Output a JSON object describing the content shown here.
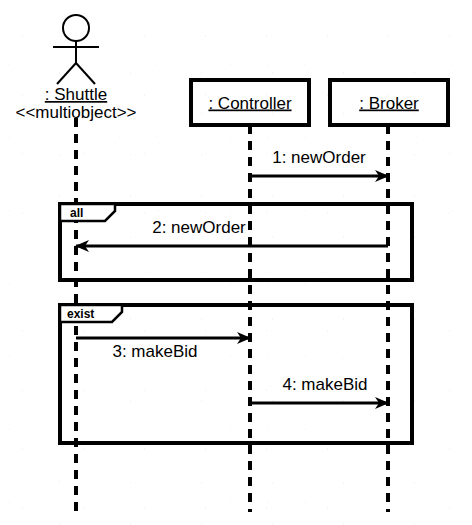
{
  "diagram": {
    "type": "uml-sequence-diagram",
    "background_color": "#ffffff",
    "line_color": "#000000",
    "canvas": {
      "width": 472,
      "height": 525
    }
  },
  "participants": [
    {
      "id": "shuttle",
      "name": ": Shuttle",
      "stereotype": "<<multiobject>>",
      "notation": "actor",
      "underlined": true,
      "lifeline_x": 76,
      "lifeline_top": 118,
      "lifeline_bottom": 512,
      "actor_icon": "stick-figure-actor-icon"
    },
    {
      "id": "controller",
      "name": ": Controller",
      "stereotype": "",
      "notation": "object-box",
      "underlined": true,
      "lifeline_x": 250,
      "lifeline_top": 125,
      "lifeline_bottom": 512,
      "box": {
        "x": 191,
        "y": 80,
        "width": 118,
        "height": 45
      }
    },
    {
      "id": "broker",
      "name": ": Broker",
      "stereotype": "",
      "notation": "object-box",
      "underlined": true,
      "lifeline_x": 388,
      "lifeline_top": 125,
      "lifeline_bottom": 512,
      "box": {
        "x": 330,
        "y": 80,
        "width": 118,
        "height": 45
      }
    }
  ],
  "messages": [
    {
      "seq": "1",
      "label": "1: newOrder",
      "from": "controller",
      "to": "broker",
      "x1": 250,
      "x2": 388,
      "y": 176,
      "direction": "right",
      "label_x": 319,
      "label_y": 163,
      "label_anchor": "middle"
    },
    {
      "seq": "2",
      "label": "2: newOrder",
      "from": "broker",
      "to": "shuttle",
      "x1": 388,
      "x2": 76,
      "y": 246,
      "direction": "left",
      "label_x": 199,
      "label_y": 233,
      "label_anchor": "middle"
    },
    {
      "seq": "3",
      "label": "3: makeBid",
      "from": "shuttle",
      "to": "controller",
      "x1": 76,
      "x2": 250,
      "y": 338,
      "direction": "right",
      "label_x": 155,
      "label_y": 357,
      "label_anchor": "middle"
    },
    {
      "seq": "4",
      "label": "4: makeBid",
      "from": "controller",
      "to": "broker",
      "x1": 250,
      "x2": 388,
      "y": 403,
      "direction": "right",
      "label_x": 325,
      "label_y": 390,
      "label_anchor": "middle"
    }
  ],
  "frames": [
    {
      "id": "frame-all",
      "label": "all",
      "x": 60,
      "y": 204,
      "width": 352,
      "height": 76,
      "tab_width": 55,
      "tab_height": 17,
      "tab_notch": 10,
      "label_x": 70,
      "label_y": 217
    },
    {
      "id": "frame-exist",
      "label": "exist",
      "x": 60,
      "y": 305,
      "width": 352,
      "height": 138,
      "tab_width": 62,
      "tab_height": 17,
      "tab_notch": 10,
      "label_x": 67,
      "label_y": 318
    }
  ],
  "labels": {
    "shuttle_name_x": 76,
    "shuttle_name_y": 100,
    "shuttle_stereotype_x": 76,
    "shuttle_stereotype_y": 118
  }
}
